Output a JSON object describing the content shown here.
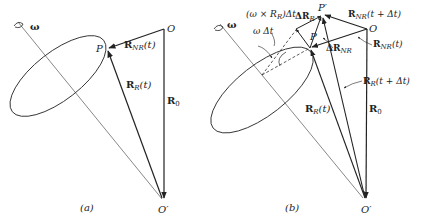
{
  "figure": {
    "panel_a": {
      "caption": "(a)",
      "labels": {
        "omega": "ω",
        "O": "O",
        "P": "P",
        "O_prime": "O′",
        "R_NR": "R",
        "R_NR_sub": "NR",
        "R_NR_arg": "(t)",
        "R_R": "R",
        "R_R_sub": "R",
        "R_R_arg": "(t)",
        "R_0": "R",
        "R_0_sub": "0"
      }
    },
    "panel_b": {
      "caption": "(b)",
      "labels": {
        "omega": "ω",
        "O": "O",
        "P": "P",
        "P_prime": "P′",
        "O_prime": "O′",
        "omega_cross": "(ω × R",
        "omega_cross_sub": "R",
        "omega_cross_tail": ")Δt",
        "omega_dt": "ω Δt",
        "delta_R_R": "ΔR",
        "delta_R_R_sub": "R",
        "delta_R_NR": "ΔR",
        "delta_R_NR_sub": "NR",
        "R_NR_tdt": "R",
        "R_NR_tdt_sub": "NR",
        "R_NR_tdt_arg": "(t + Δt)",
        "R_NR_t": "R",
        "R_NR_t_sub": "NR",
        "R_NR_t_arg": "(t)",
        "R_R_tdt": "R",
        "R_R_tdt_sub": "R",
        "R_R_tdt_arg": "(t + Δt)",
        "R_R_t": "R",
        "R_R_t_sub": "R",
        "R_R_t_arg": "(t)",
        "R_0": "R",
        "R_0_sub": "0"
      }
    },
    "colors": {
      "ink": "#222222",
      "thin": "#555555",
      "background": "#ffffff"
    }
  }
}
